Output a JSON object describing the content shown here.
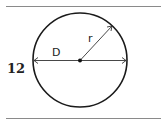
{
  "problem": {
    "number": "12"
  },
  "diagram": {
    "shape": "circle",
    "labels": {
      "diameter": "D",
      "radius": "r"
    },
    "colors": {
      "stroke": "#1a1a1a",
      "rule": "#8a8a8a"
    }
  }
}
